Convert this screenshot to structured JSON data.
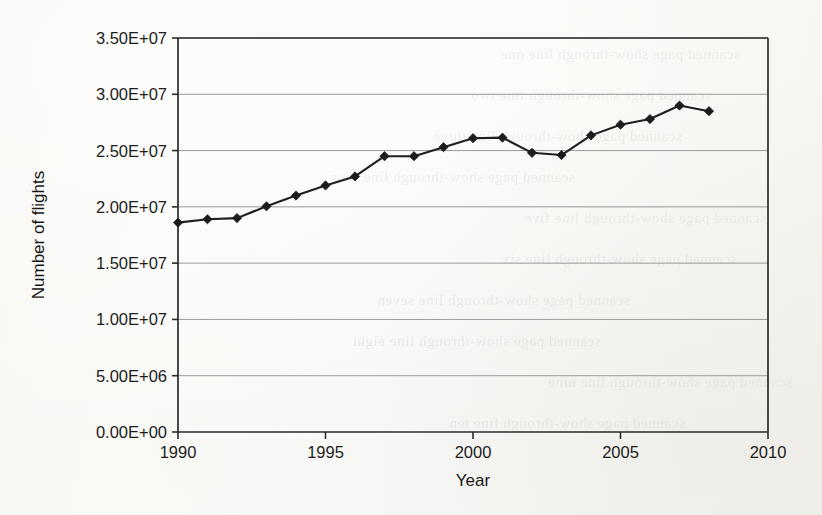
{
  "chart_data": {
    "type": "line",
    "title": "",
    "xlabel": "Year",
    "ylabel": "Number of flights",
    "xlim": [
      1990,
      2010
    ],
    "ylim": [
      0,
      35000000
    ],
    "xticks": [
      1990,
      1995,
      2000,
      2005,
      2010
    ],
    "xtick_labels": [
      "1990",
      "1995",
      "2000",
      "2005",
      "2010"
    ],
    "yticks": [
      0,
      5000000,
      10000000,
      15000000,
      20000000,
      25000000,
      30000000,
      35000000
    ],
    "ytick_labels": [
      "0.00E+00",
      "5.00E+06",
      "1.00E+07",
      "1.50E+07",
      "2.00E+07",
      "2.50E+07",
      "3.00E+07",
      "3.50E+07"
    ],
    "grid": true,
    "grid_axis": "y",
    "legend": false,
    "marker": "diamond",
    "x": [
      1990,
      1991,
      1992,
      1993,
      1994,
      1995,
      1996,
      1997,
      1998,
      1999,
      2000,
      2001,
      2002,
      2003,
      2004,
      2005,
      2006,
      2007,
      2008
    ],
    "values": [
      18600000,
      18900000,
      19000000,
      20050000,
      21000000,
      21900000,
      22700000,
      24500000,
      24500000,
      25300000,
      26100000,
      26150000,
      24800000,
      24600000,
      26350000,
      27300000,
      27800000,
      29000000,
      28500000
    ],
    "series": [
      {
        "name": "Number of flights",
        "values": [
          18600000,
          18900000,
          19000000,
          20050000,
          21000000,
          21900000,
          22700000,
          24500000,
          24500000,
          25300000,
          26100000,
          26150000,
          24800000,
          24600000,
          26350000,
          27300000,
          27800000,
          29000000,
          28500000
        ]
      }
    ]
  },
  "background_bleed": [
    "scanned page show-through line one",
    "scanned page show-through line two",
    "scanned page show-through line three",
    "scanned page show-through line four",
    "scanned page show-through line five",
    "scanned page show-through line six",
    "scanned page show-through line seven",
    "scanned page show-through line eight",
    "scanned page show-through line nine",
    "scanned page show-through line ten"
  ]
}
